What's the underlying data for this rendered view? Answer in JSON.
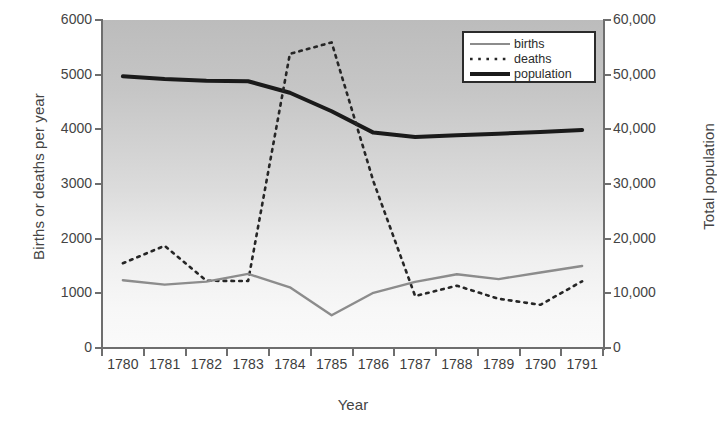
{
  "chart_data": {
    "type": "line",
    "title": "",
    "xlabel": "Year",
    "ylabel": "Births or deaths per year",
    "y2label": "Total population",
    "categories": [
      "1780",
      "1781",
      "1782",
      "1783",
      "1784",
      "1785",
      "1786",
      "1787",
      "1788",
      "1789",
      "1790",
      "1791"
    ],
    "ylim": [
      0,
      6000
    ],
    "y2lim": [
      0,
      60000
    ],
    "yticks": [
      "0",
      "1000",
      "2000",
      "3000",
      "4000",
      "5000",
      "6000"
    ],
    "y2ticks": [
      "0",
      "10,000",
      "20,000",
      "30,000",
      "40,000",
      "50,000",
      "60,000"
    ],
    "grid": false,
    "legend_position": "top-right",
    "series": [
      {
        "name": "births",
        "axis": "left",
        "style": "solid-thin",
        "color": "#8c8c8c",
        "values": [
          1240,
          1160,
          1215,
          1355,
          1110,
          600,
          1010,
          1210,
          1350,
          1260,
          1380,
          1500
        ]
      },
      {
        "name": "deaths",
        "axis": "left",
        "style": "dotted",
        "color": "#262626",
        "values": [
          1550,
          1870,
          1230,
          1225,
          5380,
          5590,
          3050,
          950,
          1140,
          900,
          790,
          1220
        ]
      },
      {
        "name": "population",
        "axis": "right",
        "style": "solid-thick",
        "color": "#1a1a1a",
        "values": [
          49700,
          49200,
          48900,
          48800,
          46700,
          43300,
          39400,
          38600,
          38900,
          39200,
          39500,
          39900
        ]
      }
    ]
  },
  "legend": {
    "items": [
      {
        "label": "births"
      },
      {
        "label": "deaths"
      },
      {
        "label": "population"
      }
    ]
  },
  "colors": {
    "births": "#8c8c8c",
    "deaths": "#262626",
    "population": "#1a1a1a",
    "axis": "#6e6e6e",
    "text": "#3d3d3d",
    "plot_bg_top": "#bcbcbc",
    "plot_bg_bottom": "#fafafa"
  }
}
